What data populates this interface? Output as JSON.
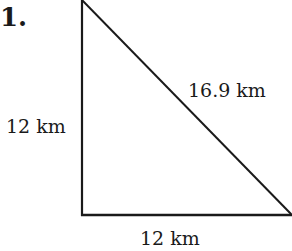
{
  "problem": {
    "number_label": "1."
  },
  "triangle": {
    "type": "right-triangle",
    "vertices": {
      "top": [
        82,
        1
      ],
      "bottom_left": [
        82,
        215
      ],
      "bottom_right": [
        291,
        215
      ]
    },
    "labels": {
      "hypotenuse": "16.9 km",
      "left_side": "12 km",
      "bottom_side": "12 km"
    },
    "stroke_color": "#1a1a1a"
  }
}
